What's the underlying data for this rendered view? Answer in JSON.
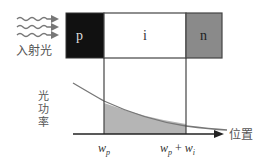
{
  "diagram": {
    "regions": [
      {
        "label": "p",
        "fill": "#111111",
        "text_color": "#dddddd"
      },
      {
        "label": "i",
        "fill": "#ffffff",
        "text_color": "#333333"
      },
      {
        "label": "n",
        "fill": "#8a8a8a",
        "text_color": "#222222"
      }
    ],
    "incident_light_label": "入射光",
    "y_axis_label": "光功率",
    "x_axis_label": "位置",
    "tick_labels": {
      "wp_main": "w",
      "wp_sub": "p",
      "wpwi_main1": "w",
      "wpwi_sub1": "p",
      "plus": " + ",
      "wpwi_main2": "w",
      "wpwi_sub2": "i"
    },
    "colors": {
      "shade": "#b5b5b5",
      "curve": "#777777",
      "axis": "#222222"
    }
  }
}
